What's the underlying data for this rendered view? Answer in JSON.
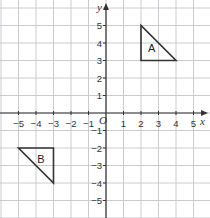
{
  "diagram": {
    "type": "coordinate-grid",
    "x_axis": {
      "label": "x",
      "min": -5,
      "max": 5,
      "ticks": [
        "-5",
        "-4",
        "-3",
        "-2",
        "-1",
        "1",
        "2",
        "3",
        "4",
        "5"
      ]
    },
    "y_axis": {
      "label": "y",
      "min": -5,
      "max": 5,
      "ticks": [
        "5",
        "4",
        "3",
        "2",
        "1",
        "-1",
        "-2",
        "-3",
        "-4",
        "-5"
      ]
    },
    "origin_label": "O",
    "shapes": [
      {
        "name": "A",
        "label": "A",
        "vertices": [
          [
            2,
            5
          ],
          [
            2,
            3
          ],
          [
            4,
            3
          ]
        ]
      },
      {
        "name": "B",
        "label": "B",
        "vertices": [
          [
            -5,
            -2
          ],
          [
            -3,
            -2
          ],
          [
            -3,
            -4
          ]
        ]
      }
    ],
    "colors": {
      "grid": "#c8ccd0",
      "axis": "#333333",
      "shape": "#333333",
      "background": "#ffffff"
    }
  }
}
